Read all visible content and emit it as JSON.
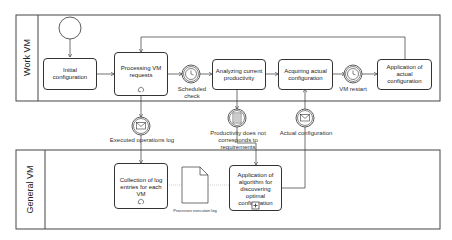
{
  "pools": [
    {
      "id": "work-vm",
      "label": "Work VM"
    },
    {
      "id": "general-vm",
      "label": "General VM"
    }
  ],
  "tasks": {
    "initial_configuration": "Initial configuration",
    "processing_vm_requests": "Processing VM requests",
    "analyzing_current_productivity": "Analyzing current productivity",
    "acquiring_actual_configuration": "Acquiring actual configuration",
    "application_of_actual_configuration": "Application of actual configuration",
    "collection_of_log_entries": "Collection of log entries for each VM",
    "application_of_algorithm": "Application of algorithm for discovering optimal configuration"
  },
  "events": {
    "scheduled_check": "Scheduled check",
    "vm_restart": "VM restart",
    "executed_operations_log": "Executed operations log",
    "productivity_not_corresponds": "Productivity does not corresponds to requirements",
    "actual_configuration": "Actual configuration"
  },
  "artifacts": {
    "processes_execution_log": "Processes execution log"
  },
  "colors": {
    "stroke": "#333333",
    "background": "#ffffff"
  }
}
